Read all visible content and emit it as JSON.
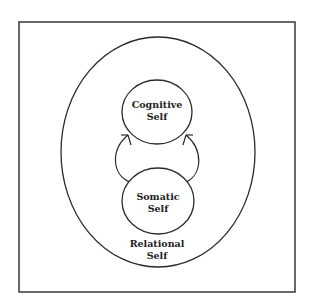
{
  "diagram": {
    "nodes": [
      {
        "id": "cognitive",
        "lines": [
          "Cognitive",
          "Self"
        ]
      },
      {
        "id": "somatic",
        "lines": [
          "Somatic",
          "Self"
        ]
      },
      {
        "id": "relational",
        "lines": [
          "Relational",
          "Self"
        ]
      }
    ],
    "edges": [
      {
        "from": "somatic",
        "to": "cognitive",
        "side": "left",
        "arrow": "up"
      },
      {
        "from": "somatic",
        "to": "cognitive",
        "side": "right",
        "arrow": "up"
      }
    ],
    "colors": {
      "stroke": "#2a2a2a",
      "background": "#ffffff"
    }
  }
}
